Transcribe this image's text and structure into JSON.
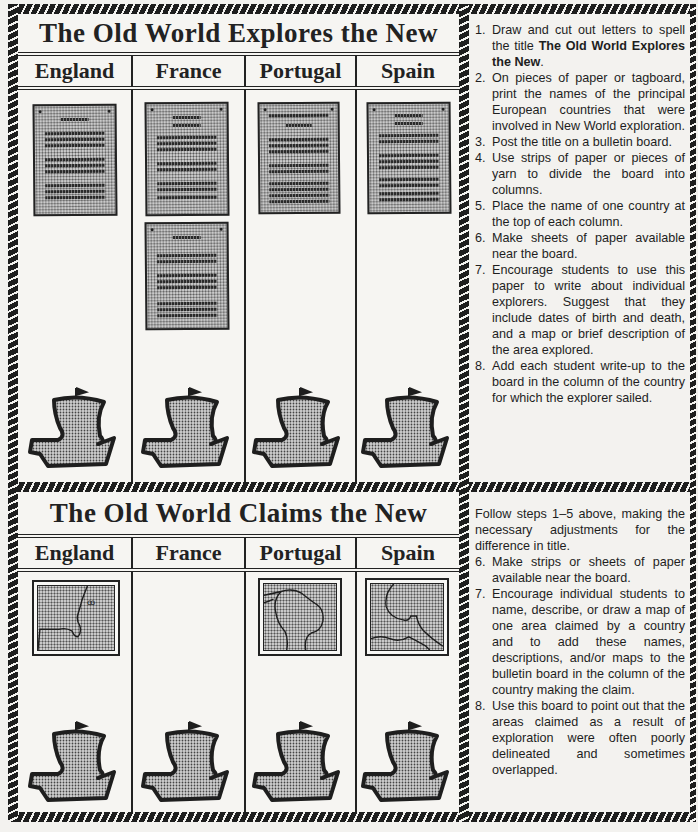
{
  "top_board": {
    "title": "The Old World Explores the New",
    "columns": [
      "England",
      "France",
      "Portugal",
      "Spain"
    ],
    "papers_per_column": [
      1,
      2,
      1,
      1
    ],
    "ships_per_column": [
      1,
      1,
      1,
      1
    ]
  },
  "bottom_board": {
    "title": "The Old World Claims the New",
    "columns": [
      "England",
      "France",
      "Portugal",
      "Spain"
    ],
    "maps_per_column": [
      1,
      0,
      1,
      1
    ],
    "ships_per_column": [
      1,
      1,
      1,
      1
    ]
  },
  "top_instructions": {
    "steps": [
      {
        "n": "1.",
        "pre": "Draw and cut out letters to spell the title ",
        "bold": "The Old World Explores the New",
        "post": "."
      },
      {
        "n": "2.",
        "pre": "On pieces of paper or tagboard, print the names of the principal European countries that were involved in New World exploration.",
        "bold": "",
        "post": ""
      },
      {
        "n": "3.",
        "pre": "Post the title on a bulletin board.",
        "bold": "",
        "post": ""
      },
      {
        "n": "4.",
        "pre": "Use strips of paper or pieces of yarn to divide the board into columns.",
        "bold": "",
        "post": ""
      },
      {
        "n": "5.",
        "pre": "Place the name of one country at the top of each column.",
        "bold": "",
        "post": ""
      },
      {
        "n": "6.",
        "pre": "Make sheets of paper available near the board.",
        "bold": "",
        "post": ""
      },
      {
        "n": "7.",
        "pre": "Encourage students to use this paper to write about individual explorers. Suggest that they include dates of birth and death, and a map or brief description of the area explored.",
        "bold": "",
        "post": ""
      },
      {
        "n": "8.",
        "pre": "Add each student write-up to the board in the column of the country for which the explorer sailed.",
        "bold": "",
        "post": ""
      }
    ]
  },
  "bottom_instructions": {
    "intro": "Follow steps 1–5 above, making the necessary adjustments for the difference in title.",
    "steps": [
      {
        "n": "6.",
        "text": "Make strips or sheets of paper available near the board."
      },
      {
        "n": "7.",
        "text": "Encourage individual students to name, describe, or draw a map of one area claimed by a country and to add these names, descriptions, and/or maps to the bulletin board in the column of the country making the claim."
      },
      {
        "n": "8.",
        "text": "Use this board to point out that the areas claimed as a result of exploration were often poorly delineated and sometimes overlapped."
      }
    ]
  },
  "icons": {
    "ship": "ship-icon",
    "paper": "document-icon",
    "map": "map-icon"
  },
  "colors": {
    "ink": "#1e1e1e",
    "paper_bg": "#f3f2ef",
    "stipple_fill": "#c9c9c9"
  }
}
